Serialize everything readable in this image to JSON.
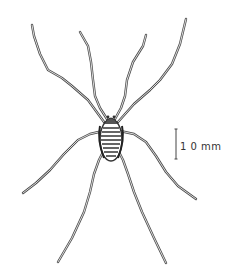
{
  "figure": {
    "background_color": "#ffffff",
    "ink_color": "#3a3a3a"
  },
  "scale_bar": {
    "label": "1 0 mm",
    "value": 10,
    "unit": "mm"
  }
}
